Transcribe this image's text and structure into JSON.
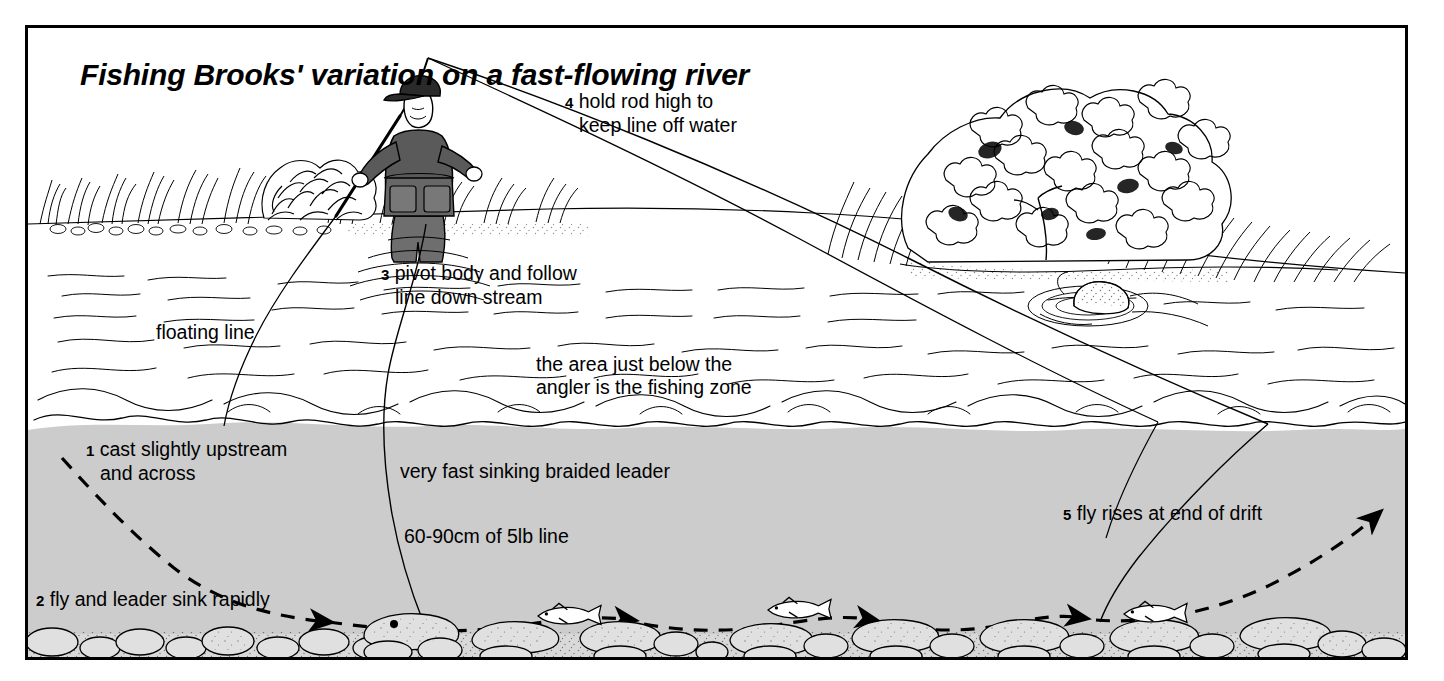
{
  "figure": {
    "title": "Fishing Brooks' variation on a fast-flowing river",
    "background_color": "#ffffff",
    "ink_color": "#000000",
    "underwater_fill": "#cccccc",
    "frame_color": "#000000"
  },
  "labels": {
    "step1": {
      "num": "1",
      "line1": "cast slightly upstream",
      "line2": "and across"
    },
    "step2": {
      "num": "2",
      "line1": "fly and leader sink rapidly"
    },
    "step3": {
      "num": "3",
      "line1": "pivot body and follow",
      "line2": "line down stream"
    },
    "step4": {
      "num": "4",
      "line1": "hold rod high to",
      "line2": "keep line off water"
    },
    "step5": {
      "num": "5",
      "line1": "fly rises at end of drift"
    },
    "floating_line": "floating line",
    "fishing_zone": {
      "line1": "the area just below the",
      "line2": "angler is the fishing zone"
    },
    "braided_leader": "very fast sinking braided leader",
    "tippet": "60-90cm of 5lb line"
  },
  "scene": {
    "angler": "wading angler holding fly rod high",
    "left_bank": "grass tufts and shrub on left bank",
    "right_bank": "large leafy bush with grasses on right bank",
    "boulder": "boulder breaking the surface with ripples",
    "riverbed": "cobbled gravel riverbed",
    "fish": "trout holding near the riverbed",
    "drift_path": "dashed line showing fly drift from cast to rise"
  }
}
